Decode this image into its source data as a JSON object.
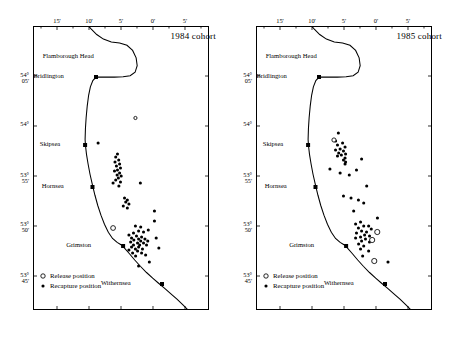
{
  "figure": {
    "panels": [
      {
        "id": "left",
        "title": "1984 cohort",
        "axes": {
          "x_tick_labels": [
            "15'",
            "10'",
            "5'",
            "0'",
            "5'"
          ],
          "x_tick_positions": [
            0.1364,
            0.3182,
            0.5,
            0.6818,
            0.8636
          ],
          "x_minor_count": 5,
          "y_tick_labels": [
            [
              "54°",
              "05'"
            ],
            [
              "54°",
              ""
            ],
            [
              "53°",
              "55'"
            ],
            [
              "53°",
              "50'"
            ],
            [
              "53°",
              "45'"
            ]
          ],
          "y_tick_positions": [
            0.1761,
            0.3521,
            0.5282,
            0.7042,
            0.8803
          ],
          "bottom_ticks": true,
          "bottom_tick_labels_shown": false
        },
        "places": [
          {
            "name": "Flamborough Head",
            "label_x": 0.345,
            "label_y": 0.105,
            "marker": false
          },
          {
            "name": "Bridlington",
            "label_x": 0.175,
            "label_y": 0.1761,
            "marker": true,
            "mx": 0.358,
            "my": 0.1796
          },
          {
            "name": "Skipsea",
            "label_x": 0.155,
            "label_y": 0.4155,
            "marker": true,
            "mx": 0.296,
            "my": 0.419
          },
          {
            "name": "Hornsea",
            "label_x": 0.175,
            "label_y": 0.5634,
            "marker": true,
            "mx": 0.338,
            "my": 0.5669
          },
          {
            "name": "Grimston",
            "label_x": 0.33,
            "label_y": 0.7711,
            "marker": true,
            "mx": 0.512,
            "my": 0.7746
          },
          {
            "name": "Withernsea",
            "label_x": 0.555,
            "label_y": 0.9049,
            "marker": true,
            "mx": 0.733,
            "my": 0.9085
          }
        ],
        "release_positions": [
          {
            "x": 0.582,
            "y": 0.3239,
            "r": 1.6
          },
          {
            "x": 0.455,
            "y": 0.7113
          }
        ],
        "recapture_positions": [
          {
            "x": 0.37,
            "y": 0.412
          },
          {
            "x": 0.48,
            "y": 0.4507
          },
          {
            "x": 0.47,
            "y": 0.4613
          },
          {
            "x": 0.487,
            "y": 0.4718
          },
          {
            "x": 0.466,
            "y": 0.4789
          },
          {
            "x": 0.492,
            "y": 0.4859
          },
          {
            "x": 0.474,
            "y": 0.493
          },
          {
            "x": 0.497,
            "y": 0.5
          },
          {
            "x": 0.48,
            "y": 0.507
          },
          {
            "x": 0.463,
            "y": 0.5106
          },
          {
            "x": 0.492,
            "y": 0.5176
          },
          {
            "x": 0.478,
            "y": 0.5246
          },
          {
            "x": 0.501,
            "y": 0.5282
          },
          {
            "x": 0.485,
            "y": 0.5352
          },
          {
            "x": 0.47,
            "y": 0.5423
          },
          {
            "x": 0.497,
            "y": 0.5493
          },
          {
            "x": 0.455,
            "y": 0.5528
          },
          {
            "x": 0.488,
            "y": 0.5634
          },
          {
            "x": 0.61,
            "y": 0.5528
          },
          {
            "x": 0.52,
            "y": 0.6056
          },
          {
            "x": 0.536,
            "y": 0.6127
          },
          {
            "x": 0.527,
            "y": 0.6197
          },
          {
            "x": 0.545,
            "y": 0.6268
          },
          {
            "x": 0.513,
            "y": 0.6338
          },
          {
            "x": 0.536,
            "y": 0.6408
          },
          {
            "x": 0.69,
            "y": 0.6866
          },
          {
            "x": 0.612,
            "y": 0.7077
          },
          {
            "x": 0.582,
            "y": 0.7042
          },
          {
            "x": 0.655,
            "y": 0.7183
          },
          {
            "x": 0.6,
            "y": 0.7218
          },
          {
            "x": 0.571,
            "y": 0.7289
          },
          {
            "x": 0.628,
            "y": 0.7254
          },
          {
            "x": 0.545,
            "y": 0.7359
          },
          {
            "x": 0.588,
            "y": 0.7394
          },
          {
            "x": 0.617,
            "y": 0.743
          },
          {
            "x": 0.56,
            "y": 0.7465
          },
          {
            "x": 0.6,
            "y": 0.75
          },
          {
            "x": 0.636,
            "y": 0.75
          },
          {
            "x": 0.573,
            "y": 0.7535
          },
          {
            "x": 0.612,
            "y": 0.757
          },
          {
            "x": 0.652,
            "y": 0.757
          },
          {
            "x": 0.555,
            "y": 0.7606
          },
          {
            "x": 0.594,
            "y": 0.7641
          },
          {
            "x": 0.628,
            "y": 0.7641
          },
          {
            "x": 0.571,
            "y": 0.7711
          },
          {
            "x": 0.606,
            "y": 0.7711
          },
          {
            "x": 0.645,
            "y": 0.7711
          },
          {
            "x": 0.56,
            "y": 0.7782
          },
          {
            "x": 0.6,
            "y": 0.7782
          },
          {
            "x": 0.582,
            "y": 0.7852
          },
          {
            "x": 0.622,
            "y": 0.7852
          },
          {
            "x": 0.545,
            "y": 0.7887
          },
          {
            "x": 0.594,
            "y": 0.7923
          },
          {
            "x": 0.566,
            "y": 0.7993
          },
          {
            "x": 0.617,
            "y": 0.7993
          },
          {
            "x": 0.583,
            "y": 0.8099
          },
          {
            "x": 0.64,
            "y": 0.8063
          },
          {
            "x": 0.7,
            "y": 0.7465
          },
          {
            "x": 0.715,
            "y": 0.7817
          },
          {
            "x": 0.661,
            "y": 0.831
          },
          {
            "x": 0.6,
            "y": 0.8451
          },
          {
            "x": 0.69,
            "y": 0.6514
          }
        ],
        "legend": {
          "release_label": "Release position",
          "recapture_label": "Recapture position"
        }
      },
      {
        "id": "right",
        "title": "1985 cohort",
        "axes": {
          "x_tick_labels": [
            "15'",
            "10'",
            "5'",
            "0'",
            "5'"
          ],
          "x_tick_positions": [
            0.1364,
            0.3182,
            0.5,
            0.6818,
            0.8636
          ],
          "x_minor_count": 5,
          "y_tick_labels": [
            [
              "54°",
              "05'"
            ],
            [
              "54°",
              ""
            ],
            [
              "53°",
              "55'"
            ],
            [
              "53°",
              "50'"
            ],
            [
              "53°",
              "45'"
            ]
          ],
          "y_tick_positions": [
            0.1761,
            0.3521,
            0.5282,
            0.7042,
            0.8803
          ],
          "bottom_ticks": true,
          "bottom_tick_labels_shown": false
        },
        "places": [
          {
            "name": "Flamborough Head",
            "label_x": 0.345,
            "label_y": 0.105,
            "marker": false
          },
          {
            "name": "Bridlington",
            "label_x": 0.175,
            "label_y": 0.1761,
            "marker": true,
            "mx": 0.358,
            "my": 0.1796
          },
          {
            "name": "Skipsea",
            "label_x": 0.155,
            "label_y": 0.4155,
            "marker": true,
            "mx": 0.296,
            "my": 0.419
          },
          {
            "name": "Hornsea",
            "label_x": 0.175,
            "label_y": 0.5634,
            "marker": true,
            "mx": 0.338,
            "my": 0.5669
          },
          {
            "name": "Grimston",
            "label_x": 0.33,
            "label_y": 0.7711,
            "marker": true,
            "mx": 0.512,
            "my": 0.7746
          },
          {
            "name": "Withernsea",
            "label_x": 0.555,
            "label_y": 0.9049,
            "marker": true,
            "mx": 0.733,
            "my": 0.9085
          }
        ],
        "release_positions": [
          {
            "x": 0.443,
            "y": 0.4014,
            "r": 2.1
          },
          {
            "x": 0.689,
            "y": 0.7254,
            "r": 2.6
          },
          {
            "x": 0.66,
            "y": 0.7535,
            "r": 2.6
          },
          {
            "x": 0.672,
            "y": 0.8275,
            "r": 2.6
          }
        ],
        "recapture_positions": [
          {
            "x": 0.468,
            "y": 0.3768
          },
          {
            "x": 0.452,
            "y": 0.4049
          },
          {
            "x": 0.492,
            "y": 0.412
          },
          {
            "x": 0.463,
            "y": 0.419
          },
          {
            "x": 0.506,
            "y": 0.4261
          },
          {
            "x": 0.478,
            "y": 0.4331
          },
          {
            "x": 0.452,
            "y": 0.4366
          },
          {
            "x": 0.497,
            "y": 0.4401
          },
          {
            "x": 0.47,
            "y": 0.4472
          },
          {
            "x": 0.509,
            "y": 0.4507
          },
          {
            "x": 0.485,
            "y": 0.4542
          },
          {
            "x": 0.463,
            "y": 0.4577
          },
          {
            "x": 0.506,
            "y": 0.4648
          },
          {
            "x": 0.497,
            "y": 0.4718
          },
          {
            "x": 0.509,
            "y": 0.4789
          },
          {
            "x": 0.506,
            "y": 0.4859
          },
          {
            "x": 0.6,
            "y": 0.4683
          },
          {
            "x": 0.42,
            "y": 0.5035
          },
          {
            "x": 0.478,
            "y": 0.5176
          },
          {
            "x": 0.53,
            "y": 0.5246
          },
          {
            "x": 0.571,
            "y": 0.507
          },
          {
            "x": 0.629,
            "y": 0.5634
          },
          {
            "x": 0.497,
            "y": 0.5986
          },
          {
            "x": 0.54,
            "y": 0.6056
          },
          {
            "x": 0.582,
            "y": 0.6127
          },
          {
            "x": 0.612,
            "y": 0.6232
          },
          {
            "x": 0.555,
            "y": 0.6514
          },
          {
            "x": 0.594,
            "y": 0.6901
          },
          {
            "x": 0.566,
            "y": 0.6972
          },
          {
            "x": 0.612,
            "y": 0.7042
          },
          {
            "x": 0.64,
            "y": 0.7042
          },
          {
            "x": 0.582,
            "y": 0.7113
          },
          {
            "x": 0.655,
            "y": 0.7148
          },
          {
            "x": 0.6,
            "y": 0.7218
          },
          {
            "x": 0.628,
            "y": 0.7254
          },
          {
            "x": 0.571,
            "y": 0.7289
          },
          {
            "x": 0.617,
            "y": 0.7359
          },
          {
            "x": 0.645,
            "y": 0.7394
          },
          {
            "x": 0.594,
            "y": 0.743
          },
          {
            "x": 0.566,
            "y": 0.7465
          },
          {
            "x": 0.622,
            "y": 0.75
          },
          {
            "x": 0.6,
            "y": 0.757
          },
          {
            "x": 0.645,
            "y": 0.7606
          },
          {
            "x": 0.583,
            "y": 0.7676
          },
          {
            "x": 0.612,
            "y": 0.7746
          },
          {
            "x": 0.594,
            "y": 0.7852
          },
          {
            "x": 0.64,
            "y": 0.7923
          },
          {
            "x": 0.75,
            "y": 0.831
          },
          {
            "x": 0.606,
            "y": 0.8099
          },
          {
            "x": 0.69,
            "y": 0.676
          }
        ],
        "legend": {
          "release_label": "Release position",
          "recapture_label": "Recapture position"
        }
      }
    ]
  }
}
